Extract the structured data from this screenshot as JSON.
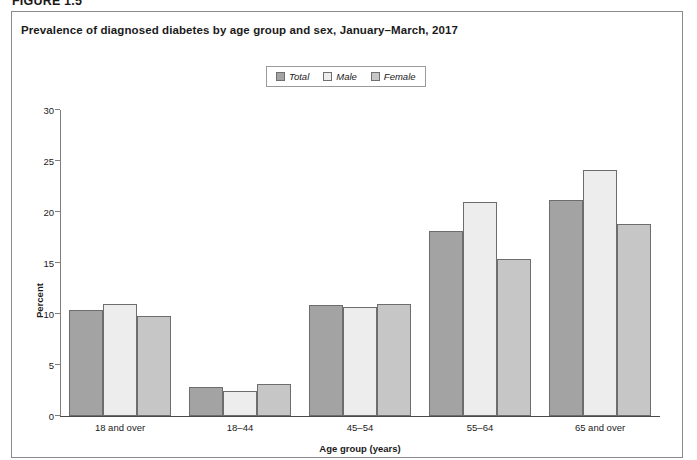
{
  "figure": {
    "label": "FIGURE 1.5",
    "title": "Prevalence of diagnosed diabetes by age group and sex, January–March, 2017"
  },
  "legend": {
    "position": "top-center",
    "items": [
      {
        "label": "Total",
        "color": "#a3a3a3"
      },
      {
        "label": "Male",
        "color": "#ededed"
      },
      {
        "label": "Female",
        "color": "#c6c6c6"
      }
    ]
  },
  "chart_data": {
    "type": "bar",
    "title": "Prevalence of diagnosed diabetes by age group and sex, January–March, 2017",
    "xlabel": "Age group (years)",
    "ylabel": "Percent",
    "categories": [
      "18 and over",
      "18–44",
      "45–54",
      "55–64",
      "65 and over"
    ],
    "series": [
      {
        "name": "Total",
        "color": "#a3a3a3",
        "values": [
          10.4,
          2.8,
          10.9,
          18.1,
          21.2
        ]
      },
      {
        "name": "Male",
        "color": "#ededed",
        "values": [
          11.0,
          2.5,
          10.7,
          21.0,
          24.1
        ]
      },
      {
        "name": "Female",
        "color": "#c6c6c6",
        "values": [
          9.8,
          3.1,
          11.0,
          15.4,
          18.8
        ]
      }
    ],
    "ylim": [
      0,
      30
    ],
    "yticks": [
      0,
      5,
      10,
      15,
      20,
      25,
      30
    ],
    "ytick_labels": [
      "0",
      "5",
      "10",
      "15",
      "20",
      "25",
      "30"
    ],
    "grid": false,
    "legend_position": "top-center"
  }
}
